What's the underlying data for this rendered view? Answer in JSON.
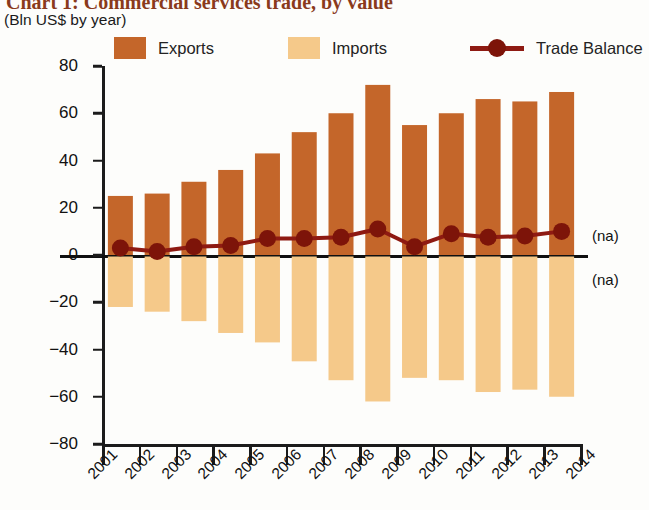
{
  "title": "Chart 1: Commercial services trade, by value",
  "subtitle": "(Bln US$ by year)",
  "legend": {
    "items": [
      {
        "label": "Exports",
        "type": "swatch",
        "color": "#c4662a",
        "icon": "square-swatch-icon"
      },
      {
        "label": "Imports",
        "type": "swatch",
        "color": "#f5c98a",
        "icon": "square-swatch-icon"
      },
      {
        "label": "Trade Balance",
        "type": "line-marker",
        "color": "#8e1a12",
        "icon": "line-marker-icon"
      }
    ]
  },
  "annotations": [
    {
      "name": "na-above-zero",
      "text": "(na)"
    },
    {
      "name": "na-below-zero",
      "text": "(na)"
    }
  ],
  "chart_data": {
    "type": "bar",
    "title": "Chart 1: Commercial services trade, by value",
    "subtitle": "(Bln US$ by year)",
    "xlabel": "",
    "ylabel": "",
    "ylim": [
      -80,
      80
    ],
    "yticks": [
      80,
      60,
      40,
      20,
      0,
      -20,
      -40,
      -60,
      -80
    ],
    "ytick_labels": [
      "80",
      "60",
      "40",
      "20",
      "0",
      "−20",
      "−40",
      "−60",
      "−80"
    ],
    "categories": [
      "2001",
      "2002",
      "2003",
      "2004",
      "2005",
      "2006",
      "2007",
      "2008",
      "2009",
      "2010",
      "2011",
      "2012",
      "2013",
      "2014"
    ],
    "xtick_labels": [
      "2001",
      "2002",
      "2003",
      "2004",
      "2005",
      "2006",
      "2007",
      "2008",
      "2009",
      "2010",
      "2011",
      "2012",
      "2013",
      "2014"
    ],
    "grid": false,
    "legend_position": "top",
    "series": [
      {
        "name": "Exports",
        "type": "bar",
        "color": "#c4662a",
        "values": [
          25,
          26,
          31,
          36,
          43,
          52,
          60,
          72,
          55,
          60,
          66,
          65,
          69,
          null
        ]
      },
      {
        "name": "Imports",
        "type": "bar",
        "color": "#f5c98a",
        "values": [
          -22,
          -24,
          -28,
          -33,
          -37,
          -45,
          -53,
          -62,
          -52,
          -53,
          -58,
          -57,
          -60,
          null
        ]
      },
      {
        "name": "Trade Balance",
        "type": "line",
        "color": "#8e1a12",
        "values": [
          3,
          1.5,
          3.5,
          4,
          7,
          7,
          7.5,
          11,
          3.5,
          9,
          7.5,
          8,
          10,
          null
        ]
      }
    ]
  }
}
